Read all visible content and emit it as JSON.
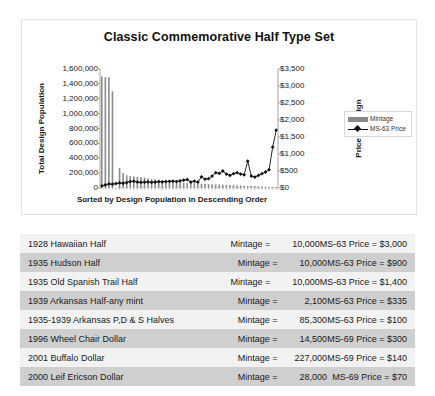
{
  "chart": {
    "title": "Classic Commemorative Half Type Set",
    "y_left_title": "Total Design Population",
    "y_right_title": "Price of Design",
    "x_title": "Sorted by Design Population in Descending Order",
    "legend": [
      {
        "key": "mintage",
        "label": "Mintage",
        "type": "bar",
        "color": "#8a8a8a"
      },
      {
        "key": "ms63",
        "label": "MS-63 Price",
        "type": "line",
        "color": "#111111"
      }
    ]
  },
  "chart_data": {
    "type": "bar",
    "title": "Classic Commemorative Half Type Set",
    "xlabel": "Sorted by Design Population in Descending Order",
    "ylabel": "Total Design Population",
    "y2label": "Price of Design",
    "grid": false,
    "legend_position": "right",
    "ylim": [
      0,
      1600000
    ],
    "y2lim": [
      0,
      3500
    ],
    "ytick_labels": [
      "0",
      "200,000",
      "400,000",
      "600,000",
      "800,000",
      "1,000,000",
      "1,200,000",
      "1,400,000",
      "1,600,000"
    ],
    "ytick_values": [
      0,
      200000,
      400000,
      600000,
      800000,
      1000000,
      1200000,
      1400000,
      1600000
    ],
    "y2tick_labels": [
      "$0",
      "$500",
      "$1,000",
      "$1,500",
      "$2,000",
      "$2,500",
      "$3,000",
      "$3,500"
    ],
    "y2tick_values": [
      0,
      500,
      1000,
      1500,
      2000,
      2500,
      3000,
      3500
    ],
    "x": [
      1,
      2,
      3,
      4,
      5,
      6,
      7,
      8,
      9,
      10,
      11,
      12,
      13,
      14,
      15,
      16,
      17,
      18,
      19,
      20,
      21,
      22,
      23,
      24,
      25,
      26,
      27,
      28,
      29,
      30,
      31,
      32,
      33,
      34,
      35,
      36,
      37,
      38,
      39,
      40,
      41,
      42,
      43,
      44,
      45,
      46,
      47,
      48,
      49,
      50
    ],
    "series": [
      {
        "name": "Mintage",
        "axis": "left",
        "type": "bar",
        "color": "#8a8a8a",
        "values": [
          1500000,
          1490000,
          1490000,
          1300000,
          0,
          270000,
          200000,
          170000,
          160000,
          155000,
          150000,
          145000,
          140000,
          130000,
          120000,
          115000,
          110000,
          100000,
          95000,
          90000,
          85000,
          80000,
          78000,
          72000,
          70000,
          68000,
          65000,
          60000,
          58000,
          55000,
          52000,
          50000,
          48000,
          46000,
          44000,
          42000,
          40000,
          38000,
          36000,
          34000,
          30000,
          28000,
          26000,
          25000,
          22000,
          20000,
          18000,
          15000,
          12000,
          10000
        ]
      },
      {
        "name": "MS-63 Price",
        "axis": "right",
        "type": "line",
        "color": "#111111",
        "values": [
          60,
          90,
          120,
          110,
          130,
          150,
          140,
          160,
          190,
          200,
          175,
          165,
          170,
          180,
          165,
          175,
          185,
          180,
          190,
          195,
          200,
          190,
          210,
          230,
          250,
          175,
          200,
          170,
          330,
          260,
          275,
          350,
          450,
          430,
          500,
          410,
          370,
          420,
          450,
          410,
          390,
          790,
          350,
          320,
          370,
          420,
          470,
          540,
          1200,
          1700
        ]
      }
    ]
  },
  "table": {
    "rows": [
      {
        "name": "1928 Hawaiian Half",
        "mintage_label": "Mintage =",
        "mintage_value": "10,000",
        "price": "MS-63 Price = $3,000"
      },
      {
        "name": "1935 Hudson Half",
        "mintage_label": "Mintage =",
        "mintage_value": "10,000",
        "price": "MS-63 Price = $900"
      },
      {
        "name": "1935 Old Spanish Trail Half",
        "mintage_label": "Mintage =",
        "mintage_value": "10,000",
        "price": "MS-63 Price = $1,400"
      },
      {
        "name": "1939 Arkansas Half-any mint",
        "mintage_label": "Mintage =",
        "mintage_value": "2,100",
        "price": "MS-63 Price = $335"
      },
      {
        "name": "1935-1939 Arkansas P,D & S Halves",
        "mintage_label": "Mintage =",
        "mintage_value": "85,300",
        "price": "MS-63 Price = $100"
      },
      {
        "name": "1996 Wheel Chair Dollar",
        "mintage_label": "Mintage =",
        "mintage_value": "14,500",
        "price": "MS-69 Price = $300"
      },
      {
        "name": "2001 Buffalo Dollar",
        "mintage_label": "Mintage =",
        "mintage_value": "227,000",
        "price": "MS-69 Price = $140"
      },
      {
        "name": "2000 Leif Ericson Dollar",
        "mintage_label": "Mintage =",
        "mintage_value": "28,000",
        "price": "MS-69 Price = $70"
      }
    ]
  }
}
